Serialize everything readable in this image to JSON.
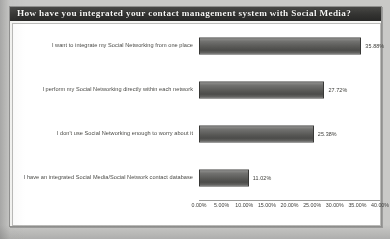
{
  "chart_data": {
    "type": "bar",
    "orientation": "horizontal",
    "title": "How have you integrated your contact management system with Social Media?",
    "xlabel": "",
    "ylabel": "",
    "xlim": [
      0,
      40
    ],
    "grid": false,
    "legend": false,
    "categories": [
      "I want to integrate my Social Networking from one place",
      "I perform my Social Networking directly within each network",
      "I don't use Social Networking enough to worry about it",
      "I have an integrated Social Media/Social Network contact database"
    ],
    "values": [
      35.88,
      27.72,
      25.38,
      11.02
    ],
    "value_labels": [
      "35.88%",
      "27.72%",
      "25.38%",
      "11.02%"
    ],
    "tick_values": [
      0,
      5,
      10,
      15,
      20,
      25,
      30,
      35,
      40
    ],
    "tick_labels": [
      "0.00%",
      "5.00%",
      "10.00%",
      "15.00%",
      "20.00%",
      "25.00%",
      "30.00%",
      "35.00%",
      "40.00%"
    ],
    "colors": {
      "bar_fill": "#5d5d5b",
      "bar_border": "#3b3b39",
      "title_band": "#363634",
      "title_text": "#f4f4f2",
      "plot_background": "#fbfbfa",
      "page_background": "#c9c9c7",
      "axis": "#9a9a98"
    }
  }
}
